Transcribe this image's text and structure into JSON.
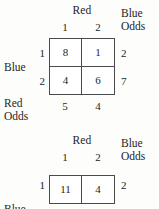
{
  "figure": {
    "background_color": "#fdfdfc",
    "rule_color": "#4a4a4a",
    "text_color": "#1d1d1d"
  },
  "tables": [
    {
      "column_group_label": "Red",
      "row_group_label": "Blue",
      "corner_label_line1": "Blue",
      "corner_label_line2": "Odds",
      "bottom_label_line1": "Red",
      "bottom_label_line2": "Odds",
      "column_headers": [
        "1",
        "2"
      ],
      "row_headers": [
        "1",
        "2"
      ],
      "cells": [
        [
          "8",
          "1"
        ],
        [
          "4",
          "6"
        ]
      ],
      "row_odds": [
        "2",
        "7"
      ],
      "column_odds": [
        "5",
        "4"
      ]
    },
    {
      "column_group_label": "Red",
      "row_group_label": "Blue",
      "corner_label_line1": "Blue",
      "corner_label_line2": "Odds",
      "column_headers": [
        "1",
        "2"
      ],
      "row_headers": [
        "1"
      ],
      "cells": [
        [
          "11",
          "4"
        ]
      ],
      "row_odds": [
        "2"
      ]
    }
  ]
}
